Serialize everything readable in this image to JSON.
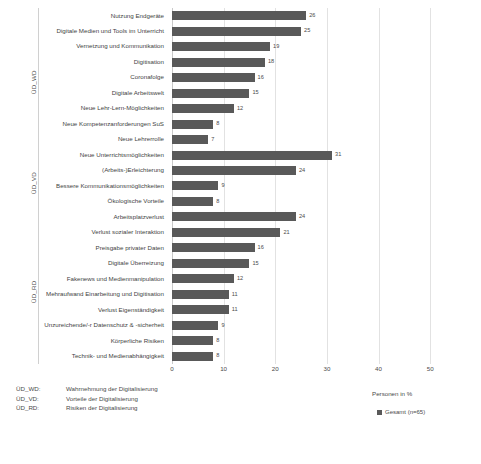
{
  "chart_data": {
    "type": "bar",
    "orientation": "horizontal",
    "title": "",
    "xlabel": "Personen in %",
    "ylabel": "",
    "xlim": [
      0,
      55
    ],
    "xticks": [
      0,
      10,
      20,
      30,
      40,
      50
    ],
    "grid": true,
    "legend": {
      "position": "bottom-right",
      "entries": [
        "Gesamt (n=65)"
      ]
    },
    "series": [
      {
        "name": "Gesamt (n=65)",
        "color": "#595959"
      }
    ],
    "groups": [
      {
        "key": "ÜD_WD",
        "label": "ÜD_WD",
        "description": "Wahrnehmung der Digitalisierung",
        "categories": [
          "Nutzung Endgeräte",
          "Digitale Medien und Tools im Unterricht",
          "Vernetzung und Kommunikation",
          "Digitisation",
          "Coronafolge",
          "Digitale Arbeitswelt",
          "Neue Lehr-Lern-Möglichkeiten",
          "Neue Kompetenzanforderungen SuS",
          "Neue Lehrerrolle"
        ],
        "values": [
          26,
          25,
          19,
          18,
          16,
          15,
          12,
          8,
          7
        ]
      },
      {
        "key": "ÜD_VD",
        "label": "ÜD_VD",
        "description": "Vorteile der Digitalisierung",
        "categories": [
          "Neue Unterrichtsmöglichkeiten",
          "(Arbeits-)Erleichterung",
          "Bessere Kommunikationsmöglichkeiten",
          "Ökologische Vorteile"
        ],
        "values": [
          31,
          24,
          9,
          8
        ]
      },
      {
        "key": "ÜD_RD",
        "label": "ÜD_RD",
        "description": "Risiken der Digitalisierung",
        "categories": [
          "Arbeitsplatzverlust",
          "Verlust sozialer Interaktion",
          "Preisgabe privater Daten",
          "Digitale Überreizung",
          "Fakenews und Medienmanipulation",
          "Mehraufwand Einarbeitung und Digitisation",
          "Verlust Eigenständigkeit",
          "Unzureichende/-r Datenschutz & -sicherheit",
          "Körperliche Risiken",
          "Technik- und Medienabhängigkeit"
        ],
        "values": [
          24,
          21,
          16,
          15,
          12,
          11,
          11,
          9,
          8,
          8
        ]
      }
    ],
    "footnote": [
      {
        "key": "ÜD_WD:",
        "desc": "Wahrnehmung der Digitalisierung"
      },
      {
        "key": "ÜD_VD:",
        "desc": "Vorteile der Digitalisierung"
      },
      {
        "key": "ÜD_RD:",
        "desc": "Risiken der Digitalisierung"
      }
    ],
    "colors": {
      "bar": "#595959",
      "grid": "#e2e2e2",
      "axis": "#c9c9c9",
      "text": "#4a4a4a"
    }
  }
}
